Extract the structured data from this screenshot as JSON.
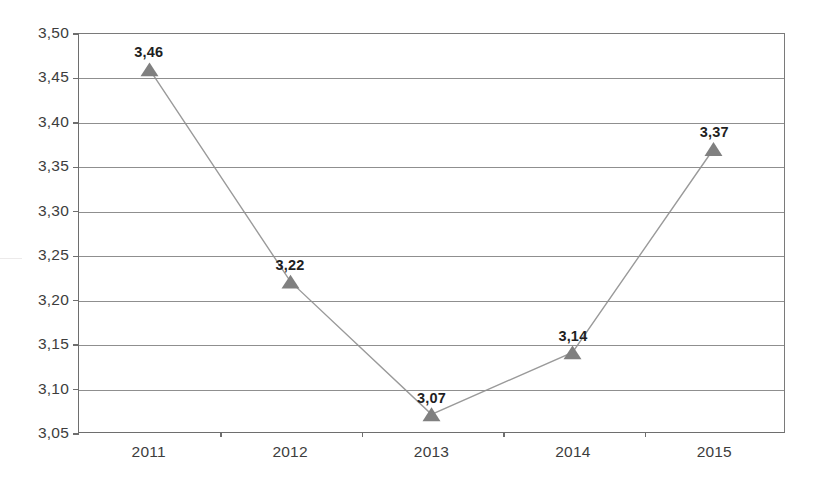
{
  "chart_data": {
    "type": "line",
    "title": "",
    "subtitle": "",
    "xlabel": "",
    "ylabel": "",
    "categories": [
      "2011",
      "2012",
      "2013",
      "2014",
      "2015"
    ],
    "values": [
      3.46,
      3.22,
      3.07,
      3.14,
      3.37
    ],
    "point_labels": [
      "3,46",
      "3,22",
      "3,07",
      "3,14",
      "3,37"
    ],
    "series": [
      {
        "name": "",
        "values": [
          3.46,
          3.22,
          3.07,
          3.14,
          3.37
        ],
        "marker": "triangle",
        "marker_color": "#808080",
        "line_color": "#9a9a9a"
      }
    ],
    "ylim": [
      3.05,
      3.5
    ],
    "ytick_step": 0.05,
    "ytick_labels": [
      "3,50",
      "3,45",
      "3,40",
      "3,35",
      "3,30",
      "3,25",
      "3,20",
      "3,15",
      "3,10",
      "3,05"
    ],
    "ytick_values": [
      3.5,
      3.45,
      3.4,
      3.35,
      3.3,
      3.25,
      3.2,
      3.15,
      3.1,
      3.05
    ],
    "xtick_labels": [
      "2011",
      "2012",
      "2013",
      "2014",
      "2015"
    ],
    "grid": "horizontal",
    "legend": "none",
    "decimal_separator": ",",
    "annotations": [],
    "colors": {
      "axis": "#6e6e6e",
      "gridline": "#8f8f8f",
      "line": "#9a9a9a",
      "marker": "#808080",
      "label_text": "#1f1f1f",
      "tick_text": "#3d3d3d",
      "background": "#ffffff"
    }
  }
}
